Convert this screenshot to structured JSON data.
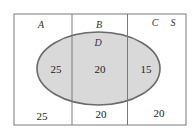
{
  "diagram": {
    "type": "venn",
    "universal_set": "S",
    "regions": [
      {
        "label": "A"
      },
      {
        "label": "B"
      },
      {
        "label": "C"
      }
    ],
    "ellipse": {
      "label": "D",
      "fill": "#d9d9d9",
      "stroke": "#6e6e6e"
    },
    "values": {
      "A_and_D": "25",
      "B_and_D": "20",
      "C_and_D": "15",
      "A_only": "25",
      "B_only": "20",
      "C_only": "20"
    },
    "colors": {
      "border": "#707070",
      "background": "#ffffff"
    }
  }
}
